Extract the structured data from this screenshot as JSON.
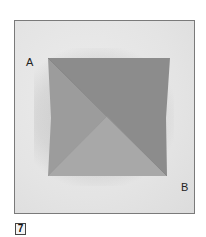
{
  "figure": {
    "step_number": "7",
    "labels": {
      "corner_a": "A",
      "corner_b": "B"
    },
    "colors": {
      "background": "#e6e6e6",
      "frame_border": "#7a7a7a",
      "paper_top_right": "#8c8c8c",
      "paper_left": "#9c9c9c",
      "paper_bottom": "#a8a8a8",
      "crease": "#7e7e7e"
    }
  }
}
